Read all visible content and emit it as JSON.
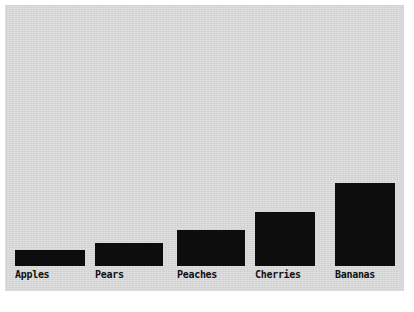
{
  "figure": {
    "background_color": "#ffffff",
    "panel_color": "#d7d7d7",
    "bar_color": "#0d0d0d",
    "panel": {
      "x": 5,
      "y": 5,
      "width": 399,
      "height": 286
    },
    "baseline_y": 266,
    "caption": ""
  },
  "chart_data": {
    "type": "bar",
    "title": "",
    "xlabel": "",
    "ylabel": "",
    "categories": [
      "Apples",
      "Pears",
      "Peaches",
      "Cherries",
      "Bananas"
    ],
    "values": [
      16,
      23,
      36,
      54,
      83
    ],
    "ylim": [
      0,
      100
    ],
    "grid": false,
    "legend": "none",
    "units": "pixels",
    "bars": [
      {
        "label": "Apples",
        "value": 16,
        "x": 15,
        "width": 70,
        "top": 250,
        "height": 16,
        "label_x": 15,
        "label_y": 269
      },
      {
        "label": "Pears",
        "value": 23,
        "x": 95,
        "width": 68,
        "top": 243,
        "height": 23,
        "label_x": 95,
        "label_y": 269
      },
      {
        "label": "Peaches",
        "value": 36,
        "x": 177,
        "width": 68,
        "top": 230,
        "height": 36,
        "label_x": 177,
        "label_y": 269
      },
      {
        "label": "Cherries",
        "value": 54,
        "x": 255,
        "width": 60,
        "top": 212,
        "height": 54,
        "label_x": 255,
        "label_y": 269
      },
      {
        "label": "Bananas",
        "value": 83,
        "x": 335,
        "width": 60,
        "top": 183,
        "height": 83,
        "label_x": 335,
        "label_y": 269
      }
    ]
  }
}
